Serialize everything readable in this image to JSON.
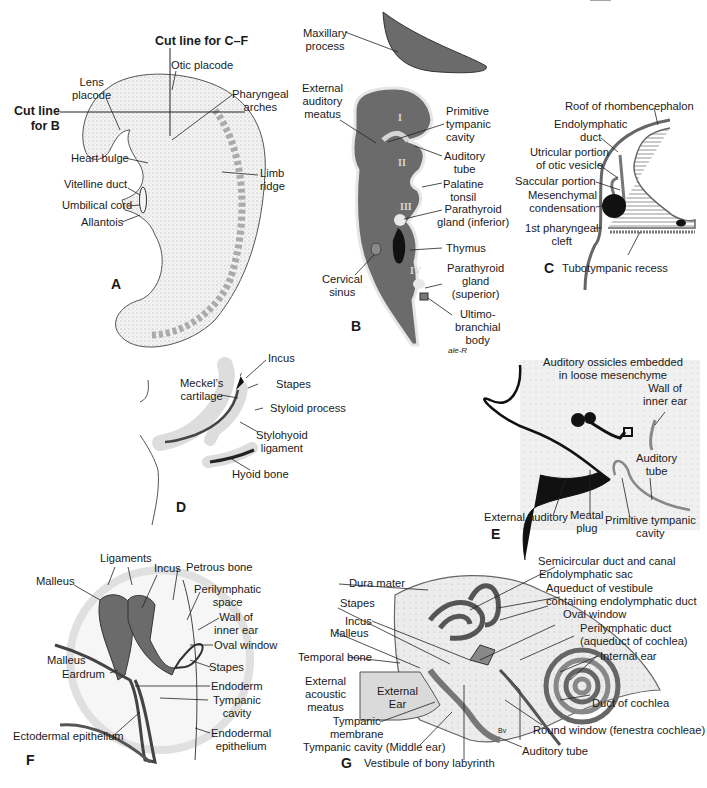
{
  "figure": {
    "colors": {
      "tissue_dark": "#6b6b6b",
      "tissue_light": "#e6e6e6",
      "ink": "#1a1a1a",
      "black_structure": "#111111"
    },
    "panels": {
      "A": {
        "letter": "A",
        "cut_line_cf": "Cut line for C–F",
        "cut_line_b": "Cut line\nfor B",
        "labels": {
          "otic_placode": "Otic placode",
          "lens_placode": "Lens\nplacode",
          "pharyngeal_arches": "Pharyngeal\narches",
          "heart_bulge": "Heart bulge",
          "limb_ridge": "Limb\nridge",
          "vitelline_duct": "Vitelline duct",
          "umbilical_cord": "Umbilical cord",
          "allantois": "Allantois"
        }
      },
      "B": {
        "letter": "B",
        "roman": [
          "I",
          "II",
          "III",
          "IV"
        ],
        "signature": "ale-R",
        "labels": {
          "maxillary_process": "Maxillary\nprocess",
          "external_auditory_meatus": "External\nauditory\nmeatus",
          "primitive_tympanic_cavity": "Primitive\ntympanic\ncavity",
          "auditory_tube": "Auditory\ntube",
          "palatine_tonsil": "Palatine\ntonsil",
          "parathyroid_inferior": "Parathyroid\ngland (inferior)",
          "thymus": "Thymus",
          "cervical_sinus": "Cervical\nsinus",
          "parathyroid_superior": "Parathyroid\ngland\n(superior)",
          "ultimobranchial_body": "Ultimo-\nbranchial\nbody"
        }
      },
      "C": {
        "letter": "C",
        "labels": {
          "roof_rhombencephalon": "Roof of rhombencephalon",
          "endolymphatic_duct": "Endolymphatic\nduct",
          "utricular_portion": "Utricular portion\nof otic vesicle",
          "saccular_portion": "Saccular portion",
          "mesenchymal_condensation": "Mesenchymal\ncondensation",
          "first_pharyngeal_cleft": "1st pharyngeal\ncleft",
          "tubotympanic_recess": "Tubotympanic recess"
        }
      },
      "D": {
        "letter": "D",
        "labels": {
          "incus": "Incus",
          "meckels_cartilage": "Meckel’s\ncartilage",
          "stapes": "Stapes",
          "styloid_process": "Styloid process",
          "stylohyoid_ligament": "Stylohyoid\nligament",
          "hyoid_bone": "Hyoid bone"
        }
      },
      "E": {
        "letter": "E",
        "labels": {
          "auditory_ossicles": "Auditory ossicles embedded\nin loose mesenchyme",
          "wall_inner_ear": "Wall of\ninner ear",
          "auditory_tube": "Auditory\ntube",
          "external_auditory": "External auditory",
          "meatal_plug": "Meatal\nplug",
          "primitive_tympanic_cavity": "Primitive tympanic\ncavity"
        }
      },
      "F": {
        "letter": "F",
        "labels": {
          "ligaments": "Ligaments",
          "incus": "Incus",
          "petrous_bone": "Petrous bone",
          "malleus_top": "Malleus",
          "perilymphatic_space": "Perilymphatic\nspace",
          "wall_inner_ear": "Wall of\ninner ear",
          "oval_window": "Oval window",
          "malleus_bottom": "Malleus",
          "stapes": "Stapes",
          "eardrum": "Eardrum",
          "endoderm": "Endoderm",
          "tympanic_cavity": "Tympanic\ncavity",
          "ectodermal_epithelium": "Ectodermal epithelium",
          "endodermal_epithelium": "Endodermal\nepithelium"
        }
      },
      "G": {
        "letter": "G",
        "bv": "Bv",
        "labels": {
          "semicircular_duct": "Semicircular duct and canal",
          "dura_mater": "Dura mater",
          "endolymphatic_sac": "Endolymphatic sac",
          "aqueduct_vestibule": "Aqueduct of vestibule\ncontaining endolymphatic duct",
          "stapes": "Stapes",
          "oval_window": "Oval window",
          "incus": "Incus",
          "perilymphatic_duct": "Perilymphatic duct\n(aqueduct of cochlea)",
          "malleus": "Malleus",
          "internal_ear": "Internal ear",
          "temporal_bone": "Temporal bone",
          "external_acoustic_meatus": "External\nacoustic\nmeatus",
          "external_ear": "External\nEar",
          "duct_of_cochlea": "Duct of cochlea",
          "tympanic_membrane": "Tympanic\nmembrane",
          "round_window": "Round window (fenestra cochleae)",
          "tympanic_cavity": "Tympanic cavity (Middle ear)",
          "auditory_tube": "Auditory tube",
          "vestibule_bony_labyrinth": "Vestibule of bony labyrinth"
        }
      }
    }
  }
}
